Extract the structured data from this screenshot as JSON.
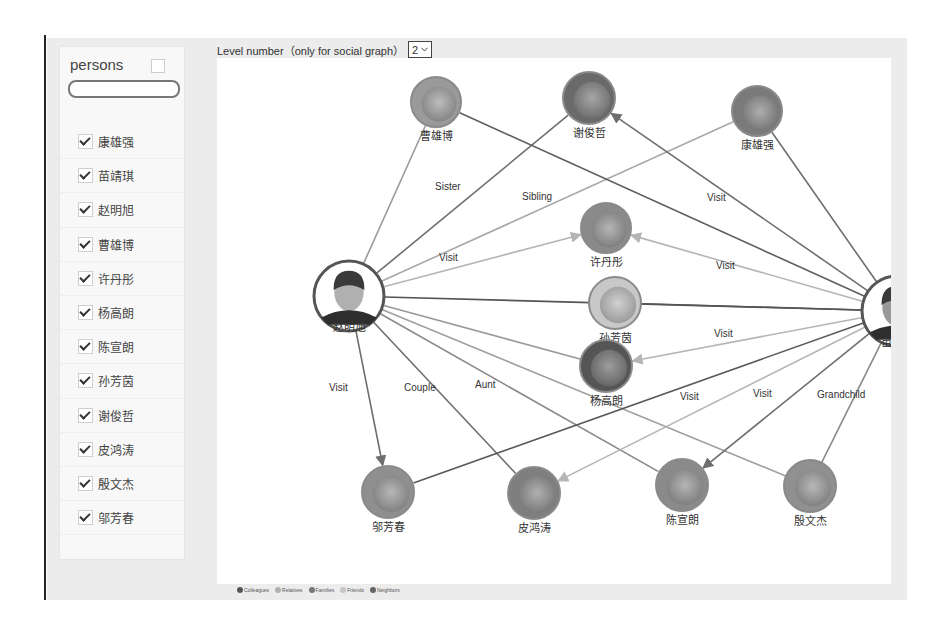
{
  "sidebar": {
    "title": "persons",
    "search_placeholder": "",
    "persons": [
      {
        "name": "康雄强",
        "checked": true
      },
      {
        "name": "苗靖琪",
        "checked": true
      },
      {
        "name": "赵明旭",
        "checked": true
      },
      {
        "name": "曹雄博",
        "checked": true
      },
      {
        "name": "许丹彤",
        "checked": true
      },
      {
        "name": "杨高朗",
        "checked": true
      },
      {
        "name": "陈宣朗",
        "checked": true
      },
      {
        "name": "孙芳茵",
        "checked": true
      },
      {
        "name": "谢俊哲",
        "checked": true
      },
      {
        "name": "皮鸿涛",
        "checked": true
      },
      {
        "name": "殷文杰",
        "checked": true
      },
      {
        "name": "邬芳春",
        "checked": true
      }
    ]
  },
  "toolbar": {
    "level_label": "Level number（only for social graph）",
    "level_value": "2",
    "level_chevron": "chevron-down-icon"
  },
  "graph": {
    "nodes": [
      {
        "id": "caoxiongbo",
        "name": "曹雄博",
        "x": 219,
        "y": 44,
        "r": 25,
        "tone": "#9a9a9a"
      },
      {
        "id": "xiejunzhe",
        "name": "谢俊哲",
        "x": 372,
        "y": 40,
        "r": 26,
        "tone": "#6a6a6a"
      },
      {
        "id": "kangxiongqiang",
        "name": "康雄强",
        "x": 540,
        "y": 53,
        "r": 25,
        "tone": "#7a7a7a"
      },
      {
        "id": "xudantong",
        "name": "许丹彤",
        "x": 389,
        "y": 170,
        "r": 25,
        "tone": "#8a8a8a"
      },
      {
        "id": "zhaomingxu",
        "name": "赵明旭",
        "x": 132,
        "y": 238,
        "r": 35,
        "tone": "#b0b0b0",
        "highlight": true
      },
      {
        "id": "sunfangyin",
        "name": "孙芳茵",
        "x": 398,
        "y": 245,
        "r": 26,
        "tone": "#c8c8c8"
      },
      {
        "id": "miaojingqi",
        "name": "苗靖琪",
        "x": 680,
        "y": 253,
        "r": 35,
        "tone": "#999999",
        "highlight": true
      },
      {
        "id": "yanggaolang",
        "name": "杨高朗",
        "x": 389,
        "y": 308,
        "r": 26,
        "tone": "#555555"
      },
      {
        "id": "wufangchun",
        "name": "邬芳春",
        "x": 171,
        "y": 434,
        "r": 26,
        "tone": "#8f8f8f"
      },
      {
        "id": "pihongtao",
        "name": "皮鸿涛",
        "x": 317,
        "y": 435,
        "r": 26,
        "tone": "#7f7f7f"
      },
      {
        "id": "chenxuanlang",
        "name": "陈宣朗",
        "x": 465,
        "y": 427,
        "r": 26,
        "tone": "#8a8a8a"
      },
      {
        "id": "yinwenjie",
        "name": "殷文杰",
        "x": 593,
        "y": 428,
        "r": 26,
        "tone": "#909090"
      }
    ],
    "edges": [
      {
        "from": "zhaomingxu",
        "to": "caoxiongbo",
        "label": "",
        "color": "#9a9a9a"
      },
      {
        "from": "zhaomingxu",
        "to": "xiejunzhe",
        "label": "Sister",
        "color": "#6e6e6e",
        "lx": 218,
        "ly": 132
      },
      {
        "from": "zhaomingxu",
        "to": "kangxiongqiang",
        "label": "Sibling",
        "color": "#a8a8a8",
        "lx": 305,
        "ly": 142
      },
      {
        "from": "zhaomingxu",
        "to": "xudantong",
        "label": "Visit",
        "color": "#b5b5b5",
        "lx": 222,
        "ly": 203,
        "arrow": true
      },
      {
        "from": "zhaomingxu",
        "to": "miaojingqi",
        "label": "",
        "color": "#555555"
      },
      {
        "from": "zhaomingxu",
        "to": "yanggaolang",
        "label": "",
        "color": "#999999"
      },
      {
        "from": "zhaomingxu",
        "to": "wufangchun",
        "label": "Visit",
        "color": "#6e6e6e",
        "lx": 112,
        "ly": 333,
        "arrow": true
      },
      {
        "from": "zhaomingxu",
        "to": "pihongtao",
        "label": "Couple",
        "color": "#6e6e6e",
        "lx": 187,
        "ly": 333
      },
      {
        "from": "zhaomingxu",
        "to": "chenxuanlang",
        "label": "Aunt",
        "color": "#8a8a8a",
        "lx": 258,
        "ly": 330
      },
      {
        "from": "zhaomingxu",
        "to": "yinwenjie",
        "label": "",
        "color": "#a0a0a0"
      },
      {
        "from": "miaojingqi",
        "to": "caoxiongbo",
        "label": "",
        "color": "#5e5e5e"
      },
      {
        "from": "miaojingqi",
        "to": "xiejunzhe",
        "label": "Visit",
        "color": "#6e6e6e",
        "lx": 490,
        "ly": 143,
        "arrow": true
      },
      {
        "from": "miaojingqi",
        "to": "kangxiongqiang",
        "label": "",
        "color": "#6e6e6e"
      },
      {
        "from": "miaojingqi",
        "to": "xudantong",
        "label": "Visit",
        "color": "#b5b5b5",
        "lx": 499,
        "ly": 211,
        "arrow": true
      },
      {
        "from": "miaojingqi",
        "to": "sunfangyin",
        "label": "",
        "color": "#555555"
      },
      {
        "from": "miaojingqi",
        "to": "yanggaolang",
        "label": "Visit",
        "color": "#b5b5b5",
        "lx": 497,
        "ly": 279,
        "arrow": true
      },
      {
        "from": "miaojingqi",
        "to": "wufangchun",
        "label": "",
        "color": "#5a5a5a"
      },
      {
        "from": "miaojingqi",
        "to": "pihongtao",
        "label": "Visit",
        "color": "#b5b5b5",
        "lx": 463,
        "ly": 342,
        "arrow": true
      },
      {
        "from": "miaojingqi",
        "to": "chenxuanlang",
        "label": "Visit",
        "color": "#6e6e6e",
        "lx": 536,
        "ly": 339,
        "arrow": true
      },
      {
        "from": "miaojingqi",
        "to": "yinwenjie",
        "label": "Grandchild",
        "color": "#8a8a8a",
        "lx": 600,
        "ly": 340
      }
    ]
  },
  "legend": [
    {
      "label": "Colleagues",
      "color": "#555555"
    },
    {
      "label": "Relatives",
      "color": "#b0b0b0"
    },
    {
      "label": "Families",
      "color": "#777777"
    },
    {
      "label": "Friends",
      "color": "#c5c5c5"
    },
    {
      "label": "Neighbors",
      "color": "#666666"
    }
  ]
}
